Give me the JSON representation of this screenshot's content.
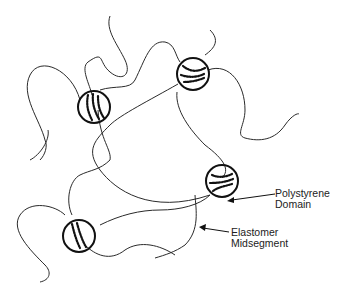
{
  "labels": {
    "polystyrene": [
      "Polystyrene",
      "Domain"
    ],
    "elastomer": [
      "Elastomer",
      "Midsegment"
    ]
  },
  "colors": {
    "line": "#2a2a2a",
    "background": "#ffffff"
  }
}
